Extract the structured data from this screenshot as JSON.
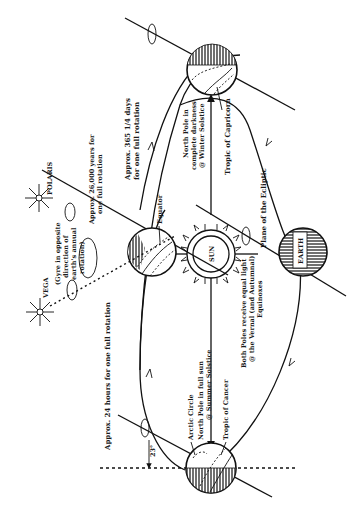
{
  "diagram": {
    "orientation": "rotated 90 degrees (text reads bottom-to-top)",
    "labels": {
      "sun": "SUN",
      "earth": "EARTH",
      "polaris": "POLARIS",
      "vega": "VEGA",
      "precession": "Approx. 26,000 years for one full rotation",
      "precession_line1": "Approx. 26,000 years for",
      "precession_line2": "one full rotation",
      "gyre_line1": "(Gyre in opposite",
      "gyre_line2": "direction of",
      "gyre_line3": "earth's annual",
      "gyre_line4": "rotation)",
      "orbit_line1": "Approx. 365 1/4 days",
      "orbit_line2": "for one full rotation",
      "daily_rotation": "Approx. 24 hours for one full rotation",
      "equator": "Equator",
      "arctic_circle": "Arctic Circle",
      "tropic_cancer": "Tropic of Cancer",
      "tropic_capricorn": "Tropic of Capricorn",
      "plane_ecliptic": "Plane of the Ecliptic",
      "winter_line1": "North Pole in",
      "winter_line2": "complete darkness",
      "winter_line3": "@ Winter Solstice",
      "summer_line1": "North Pole in full sun",
      "summer_line2": "@ Summer Solstice",
      "equinox_line1": "Both Poles receive equal light",
      "equinox_line2": "@ the Vernal (and Autumnal)",
      "equinox_line3": "Equinoxes",
      "tilt_angle": "23°"
    },
    "colors": {
      "ink": "#111111",
      "background": "#ffffff"
    }
  }
}
